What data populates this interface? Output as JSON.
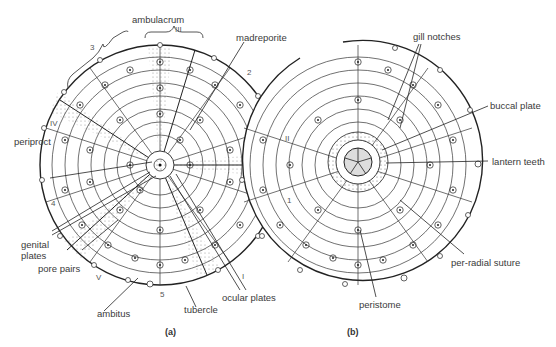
{
  "figure": {
    "panels": [
      {
        "id": "a",
        "caption": "(a)"
      },
      {
        "id": "b",
        "caption": "(b)"
      }
    ],
    "labels_a": {
      "ambulacrum": "ambulacrum",
      "ambulacrum_numeral": "III",
      "madreporite": "madreporite",
      "periproct": "periproct",
      "genital_plates": "genital plates",
      "pore_pairs": "pore pairs",
      "ambitus": "ambitus",
      "tubercle": "tubercle",
      "ocular_plates": "ocular plates"
    },
    "labels_b": {
      "gill_notches": "gill notches",
      "buccal_plate": "buccal plate",
      "lantern_teeth": "lantern teeth",
      "per_radial_suture": "per-radial suture",
      "peristome": "peristome"
    },
    "numerals": {
      "III": "III",
      "II": "II",
      "I": "I",
      "IV": "IV",
      "V": "V"
    },
    "interambulacra": {
      "n1": "1",
      "n2": "2",
      "n3": "3",
      "n4": "4",
      "n5": "5"
    },
    "colors": {
      "line": "#222222",
      "text": "#3a3a3a",
      "background": "#ffffff"
    }
  }
}
